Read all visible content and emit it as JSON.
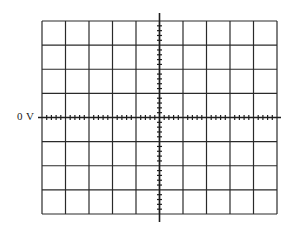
{
  "graticule": {
    "zero_label": "0 V",
    "divisions_x": 10,
    "divisions_y": 8,
    "subdivisions": 5,
    "line_color": "#2a2a2a",
    "background": "#ffffff",
    "grid_left": 42,
    "grid_top": 21,
    "grid_right": 277,
    "grid_bottom": 214,
    "center_x": 159.5,
    "center_y": 117.5,
    "vertical_axis_top": 13,
    "vertical_axis_bottom": 222
  }
}
